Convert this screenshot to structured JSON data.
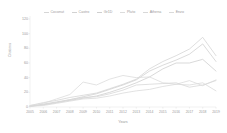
{
  "chart_data": {
    "type": "line",
    "title": "",
    "xlabel": "Years",
    "ylabel": "Citations",
    "legend_position": "top",
    "grid": false,
    "xlim": [
      2005,
      2019
    ],
    "ylim": [
      0,
      120
    ],
    "yticks": [
      120,
      100,
      80,
      60,
      40,
      20,
      0
    ],
    "categories": [
      2005,
      2006,
      2007,
      2008,
      2009,
      2010,
      2011,
      2012,
      2013,
      2014,
      2015,
      2016,
      2017,
      2018,
      2019
    ],
    "x": [
      "2005",
      "2006",
      "2007",
      "2008",
      "2009",
      "2010",
      "2011",
      "2012",
      "2013",
      "2014",
      "2015",
      "2016",
      "2017",
      "2018",
      "2019"
    ],
    "series": [
      {
        "name": "Coconut",
        "color": "#d6d6d6",
        "values": [
          2,
          6,
          9,
          13,
          16,
          19,
          25,
          31,
          38,
          52,
          62,
          70,
          79,
          95,
          70
        ]
      },
      {
        "name": "Castro",
        "color": "#d2d2d2",
        "values": [
          1,
          4,
          7,
          10,
          14,
          18,
          24,
          30,
          37,
          49,
          57,
          64,
          72,
          86,
          62
        ]
      },
      {
        "name": "Gr1D",
        "color": "#cfcfcf",
        "values": [
          1,
          3,
          6,
          9,
          12,
          15,
          20,
          26,
          33,
          41,
          52,
          60,
          60,
          65,
          49
        ]
      },
      {
        "name": "Pluto",
        "color": "#dcdcdc",
        "values": [
          2,
          5,
          11,
          17,
          34,
          30,
          38,
          43,
          40,
          41,
          33,
          31,
          36,
          29,
          37
        ]
      },
      {
        "name": "Athena",
        "color": "#d8d8d8",
        "values": [
          1,
          3,
          6,
          10,
          13,
          14,
          18,
          23,
          30,
          31,
          32,
          33,
          27,
          30,
          36
        ]
      },
      {
        "name": "Enzo",
        "color": "#dadada",
        "values": [
          1,
          2,
          5,
          8,
          11,
          12,
          15,
          19,
          22,
          24,
          28,
          31,
          30,
          33,
          22
        ]
      }
    ]
  },
  "axes": {
    "y_title": "Citations",
    "x_title": "Years"
  }
}
